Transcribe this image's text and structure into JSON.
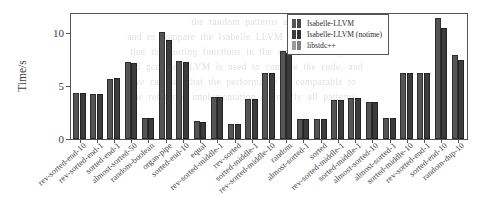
{
  "chart_data": {
    "type": "bar",
    "title": "",
    "xlabel": "",
    "ylabel": "Time/s",
    "ylim": [
      0,
      11.8
    ],
    "yticks": [
      0,
      5,
      10
    ],
    "ytick_labels": [
      "0",
      "5",
      "10"
    ],
    "grid": false,
    "legend_position": "top-right",
    "categories": [
      "rev-sorted-end-10",
      "rev-sorted-end-1",
      "sorted-end-1",
      "almost-sorted-50",
      "random-boolean",
      "organ-pipe",
      "sorted-end-10",
      "equal",
      "rev-sorted-middle-1",
      "rev-sorted",
      "sorted-middle-1",
      "rev-sorted-middle-10",
      "random",
      "almost-sorted-1",
      "sorted",
      "rev-sorted-middle-1",
      "sorted-middle-1",
      "almost-sorted-10",
      "almost-sorted-1",
      "sorted-middle-10",
      "rev-sorted-end-1",
      "sorted-end-10",
      "random-dup-10"
    ],
    "series": [
      {
        "name": "Isabelle-LLVM",
        "color": "#555555",
        "values": [
          4.2,
          4.1,
          5.5,
          7.1,
          1.8,
          9.9,
          7.2,
          1.5,
          3.8,
          1.2,
          3.6,
          6.0,
          8.1,
          1.7,
          1.7,
          3.5,
          3.7,
          3.3,
          1.8,
          6.0,
          6.0,
          11.2,
          7.7
        ]
      },
      {
        "name": "Isabelle-LLVM (notime)",
        "color": "#3c3c3c",
        "values": [
          4.2,
          4.1,
          5.6,
          7.0,
          1.8,
          9.2,
          7.1,
          1.4,
          3.8,
          1.2,
          3.6,
          6.0,
          7.9,
          1.7,
          1.7,
          3.5,
          3.7,
          3.3,
          1.8,
          6.0,
          6.0,
          10.3,
          7.3
        ]
      },
      {
        "name": "libstdc++",
        "color": "#9a9a9a",
        "values": [
          0,
          0,
          0,
          0,
          0,
          0,
          0,
          0,
          0,
          0,
          0,
          0,
          0,
          0,
          0,
          0,
          0,
          0,
          0,
          0,
          0,
          0,
          0
        ]
      }
    ]
  },
  "legend": {
    "items": [
      {
        "label": "Isabelle-LLVM"
      },
      {
        "label": "Isabelle-LLVM (notime)"
      },
      {
        "label": "libstdc++"
      }
    ]
  },
  "background_text": {
    "line1": "the  random  patterns  and",
    "line2": "and  to  compare  the  Isabelle  LLVM  sorting  algorithm",
    "line3": "that  the  sorting  functions  in  the  standard  library  of",
    "line4": "and  gcc  the  LLVM  is  used  to  compile  the  code,  and",
    "line5": "we  can  see  that  the  performance  is  comparable  to",
    "line6": "the  reference  implementation  on  nearly  all  patterns."
  }
}
